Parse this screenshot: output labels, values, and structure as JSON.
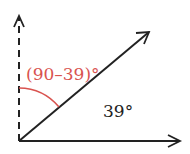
{
  "diagram": {
    "type": "angle-diagram",
    "origin": {
      "x": 19,
      "y": 141
    },
    "rays": [
      {
        "name": "vertical-dashed-ray",
        "style": "dashed",
        "color": "#222222",
        "end": {
          "x": 19,
          "y": 15
        }
      },
      {
        "name": "horizontal-ray",
        "style": "solid",
        "color": "#222222",
        "end": {
          "x": 181,
          "y": 141
        }
      },
      {
        "name": "diagonal-ray",
        "style": "solid",
        "color": "#222222",
        "end": {
          "x": 150,
          "y": 31
        }
      }
    ],
    "arc": {
      "color": "#d9534f",
      "between": [
        "vertical-dashed-ray",
        "diagonal-ray"
      ]
    },
    "labels": {
      "complement_angle": "(90–39)°",
      "given_angle": "39°"
    },
    "colors": {
      "line": "#222222",
      "accent": "#d9534f",
      "background": "#ffffff"
    }
  }
}
